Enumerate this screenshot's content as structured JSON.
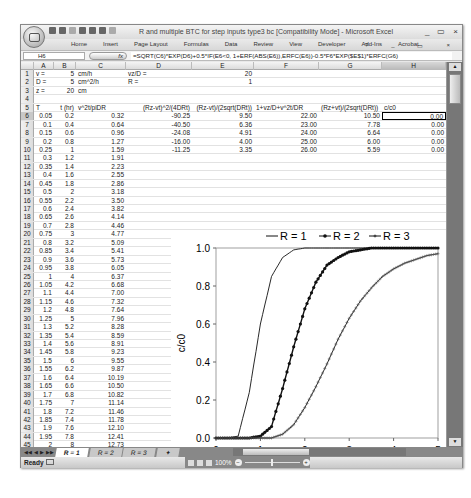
{
  "window": {
    "title": "R and multiple BTC for step inputs type3 bc  [Compatibility Mode] - Microsoft Excel",
    "controls": [
      "_",
      "▭",
      "×"
    ],
    "doc_controls": [
      "?",
      "_",
      "▭",
      "×"
    ]
  },
  "ribbon": {
    "tabs": [
      "Home",
      "Insert",
      "Page Layout",
      "Formulas",
      "Data",
      "Review",
      "View",
      "Developer",
      "Add-Ins",
      "Acrobat"
    ]
  },
  "formula_bar": {
    "name_box": "H6",
    "fx_label": "fx",
    "formula": "=SQRT(C6)*EXP(D6)+0.5*IF(E6<0, 1+ERF(ABS(E6)),ERFC(E6))-0.5*F6*EXP($E$1)*ERFC(G6)"
  },
  "columns": [
    {
      "label": "A"
    },
    {
      "label": "B"
    },
    {
      "label": "C"
    },
    {
      "label": "D"
    },
    {
      "label": "E"
    },
    {
      "label": "F"
    },
    {
      "label": "G"
    },
    {
      "label": "H"
    }
  ],
  "params": {
    "r1": {
      "a": "v =",
      "b": "5",
      "c": "cm/h",
      "d": "vz/D =",
      "e": "20"
    },
    "r2": {
      "a": "D =",
      "b": "5",
      "c": "cm^2/h",
      "d": "R =",
      "e": "1"
    },
    "r3": {
      "a": "z =",
      "b": "20",
      "c": "cm"
    }
  },
  "headers": {
    "a": "T",
    "b": "t (hr)",
    "c": "v^2t/piDR",
    "d": "(Rz-vt)^2/(4DRt)",
    "e": "(Rz-vt)/(2sqrt(DRt))",
    "f": "1+vz/D+v^2t/DR",
    "g": "(Rz+vt)/(2sqrt(DRt))",
    "h": "c/c0"
  },
  "full_rows": [
    {
      "n": "6",
      "T": "0.05",
      "t": "0.2",
      "c": "0.32",
      "d": "-90.25",
      "e": "9.50",
      "f": "22.00",
      "g": "10.50",
      "h": "0.00"
    },
    {
      "n": "7",
      "T": "0.1",
      "t": "0.4",
      "c": "0.64",
      "d": "-40.50",
      "e": "6.36",
      "f": "23.00",
      "g": "7.78",
      "h": "0.00"
    },
    {
      "n": "8",
      "T": "0.15",
      "t": "0.6",
      "c": "0.96",
      "d": "-24.08",
      "e": "4.91",
      "f": "24.00",
      "g": "6.64",
      "h": "0.00"
    },
    {
      "n": "9",
      "T": "0.2",
      "t": "0.8",
      "c": "1.27",
      "d": "-16.00",
      "e": "4.00",
      "f": "25.00",
      "g": "6.00",
      "h": "0.00"
    },
    {
      "n": "10",
      "T": "0.25",
      "t": "1",
      "c": "1.59",
      "d": "-11.25",
      "e": "3.35",
      "f": "26.00",
      "g": "5.59",
      "h": "0.00"
    }
  ],
  "rows": [
    {
      "n": "11",
      "T": "0.3",
      "t": "1.2",
      "c": "1.91"
    },
    {
      "n": "12",
      "T": "0.35",
      "t": "1.4",
      "c": "2.23"
    },
    {
      "n": "13",
      "T": "0.4",
      "t": "1.6",
      "c": "2.55"
    },
    {
      "n": "14",
      "T": "0.45",
      "t": "1.8",
      "c": "2.86"
    },
    {
      "n": "15",
      "T": "0.5",
      "t": "2",
      "c": "3.18"
    },
    {
      "n": "16",
      "T": "0.55",
      "t": "2.2",
      "c": "3.50"
    },
    {
      "n": "17",
      "T": "0.6",
      "t": "2.4",
      "c": "3.82"
    },
    {
      "n": "18",
      "T": "0.65",
      "t": "2.6",
      "c": "4.14"
    },
    {
      "n": "19",
      "T": "0.7",
      "t": "2.8",
      "c": "4.46"
    },
    {
      "n": "20",
      "T": "0.75",
      "t": "3",
      "c": "4.77"
    },
    {
      "n": "21",
      "T": "0.8",
      "t": "3.2",
      "c": "5.09"
    },
    {
      "n": "22",
      "T": "0.85",
      "t": "3.4",
      "c": "5.41"
    },
    {
      "n": "23",
      "T": "0.9",
      "t": "3.6",
      "c": "5.73"
    },
    {
      "n": "24",
      "T": "0.95",
      "t": "3.8",
      "c": "6.05"
    },
    {
      "n": "25",
      "T": "1",
      "t": "4",
      "c": "6.37"
    },
    {
      "n": "26",
      "T": "1.05",
      "t": "4.2",
      "c": "6.68"
    },
    {
      "n": "27",
      "T": "1.1",
      "t": "4.4",
      "c": "7.00"
    },
    {
      "n": "28",
      "T": "1.15",
      "t": "4.6",
      "c": "7.32"
    },
    {
      "n": "29",
      "T": "1.2",
      "t": "4.8",
      "c": "7.64"
    },
    {
      "n": "30",
      "T": "1.25",
      "t": "5",
      "c": "7.96"
    },
    {
      "n": "31",
      "T": "1.3",
      "t": "5.2",
      "c": "8.28"
    },
    {
      "n": "32",
      "T": "1.35",
      "t": "5.4",
      "c": "8.59"
    },
    {
      "n": "33",
      "T": "1.4",
      "t": "5.6",
      "c": "8.91"
    },
    {
      "n": "34",
      "T": "1.45",
      "t": "5.8",
      "c": "9.23"
    },
    {
      "n": "35",
      "T": "1.5",
      "t": "6",
      "c": "9.55"
    },
    {
      "n": "36",
      "T": "1.55",
      "t": "6.2",
      "c": "9.87"
    },
    {
      "n": "37",
      "T": "1.6",
      "t": "6.4",
      "c": "10.19"
    },
    {
      "n": "38",
      "T": "1.65",
      "t": "6.6",
      "c": "10.50"
    },
    {
      "n": "39",
      "T": "1.7",
      "t": "6.8",
      "c": "10.82"
    },
    {
      "n": "40",
      "T": "1.75",
      "t": "7",
      "c": "11.14"
    },
    {
      "n": "41",
      "T": "1.8",
      "t": "7.2",
      "c": "11.46"
    },
    {
      "n": "42",
      "T": "1.85",
      "t": "7.4",
      "c": "11.78"
    },
    {
      "n": "43",
      "T": "1.9",
      "t": "7.6",
      "c": "12.10"
    },
    {
      "n": "44",
      "T": "1.95",
      "t": "7.8",
      "c": "12.41"
    },
    {
      "n": "45",
      "T": "2",
      "t": "8",
      "c": "12.73"
    }
  ],
  "sheet_tabs": [
    "R = 1",
    "R = 2",
    "R = 3"
  ],
  "status": {
    "ready": "Ready",
    "zoom": "100%"
  },
  "chart_data": {
    "type": "line",
    "title": "",
    "xlabel": "T",
    "ylabel": "c/c0",
    "xlim": [
      0,
      5
    ],
    "ylim": [
      0,
      1
    ],
    "xticks": [
      "0",
      "1",
      "2",
      "3",
      "4",
      "5"
    ],
    "yticks": [
      "0.0",
      "0.2",
      "0.4",
      "0.6",
      "0.8",
      "1.0"
    ],
    "legend_position": "top",
    "grid": false,
    "x": [
      0,
      0.25,
      0.5,
      0.75,
      1,
      1.25,
      1.5,
      1.75,
      2,
      2.25,
      2.5,
      2.75,
      3,
      3.25,
      3.5,
      3.75,
      4,
      4.25,
      4.5,
      4.75,
      5
    ],
    "series": [
      {
        "name": "R = 1",
        "marker": "none",
        "values": [
          0,
          0,
          0.01,
          0.24,
          0.6,
          0.85,
          0.95,
          0.99,
          1,
          1,
          1,
          1,
          1,
          1,
          1,
          1,
          1,
          1,
          1,
          1,
          1
        ]
      },
      {
        "name": "R = 2",
        "marker": "dot",
        "values": [
          0,
          0,
          0,
          0,
          0.01,
          0.06,
          0.26,
          0.48,
          0.68,
          0.82,
          0.91,
          0.95,
          0.98,
          0.99,
          1,
          1,
          1,
          1,
          1,
          1,
          1
        ]
      },
      {
        "name": "R = 3",
        "marker": "plus",
        "values": [
          0,
          0,
          0,
          0,
          0,
          0,
          0.02,
          0.07,
          0.16,
          0.27,
          0.39,
          0.52,
          0.63,
          0.72,
          0.79,
          0.85,
          0.89,
          0.92,
          0.94,
          0.96,
          0.97
        ]
      }
    ]
  }
}
